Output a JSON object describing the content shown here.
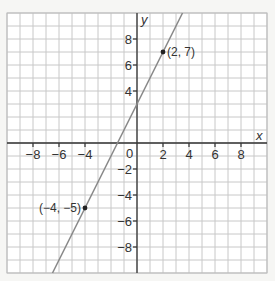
{
  "chart_data": {
    "type": "line",
    "title": "",
    "xlabel": "x",
    "ylabel": "y",
    "xlim": [
      -10,
      10
    ],
    "ylim": [
      -10,
      10
    ],
    "grid": true,
    "x_ticks": [
      -8,
      -6,
      -4,
      2,
      4,
      6,
      8
    ],
    "y_ticks": [
      8,
      6,
      4,
      -2,
      -4,
      -6,
      -8
    ],
    "origin_label": "0",
    "x_tick_labels": [
      "−8",
      "−6",
      "−4",
      "2",
      "4",
      "6",
      "8"
    ],
    "y_tick_labels": [
      "8",
      "6",
      "4",
      "−2",
      "−4",
      "−6",
      "−8"
    ],
    "series": [
      {
        "name": "y = 2x + 3",
        "x": [
          -6.5,
          3.5
        ],
        "y": [
          -10,
          10
        ],
        "color": "#888888"
      }
    ],
    "points": [
      {
        "x": 2,
        "y": 7,
        "label": "(2, 7)"
      },
      {
        "x": -4,
        "y": -5,
        "label": "(−4, −5)"
      }
    ]
  },
  "colors": {
    "background": "#f6f6f4",
    "grid": "#c8c8c8",
    "axis": "#333333",
    "line": "#888888",
    "point": "#222222"
  }
}
